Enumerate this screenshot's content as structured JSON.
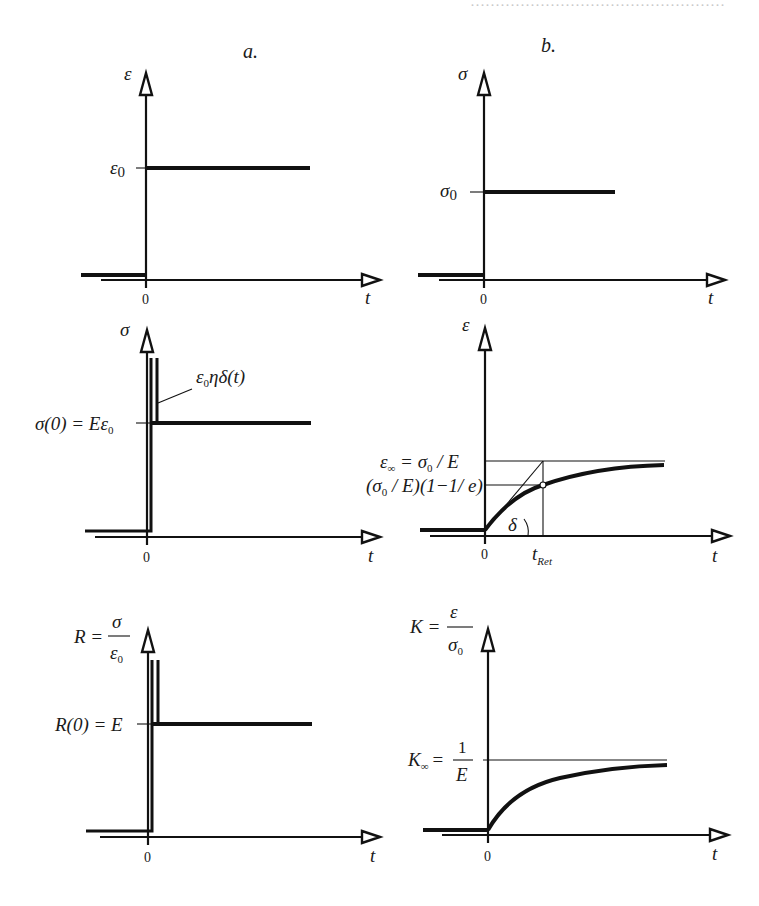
{
  "figure": {
    "column_labels": {
      "a": "a.",
      "b": "b."
    },
    "panels": {
      "a1": {
        "y_axis_label": "ε",
        "x_axis_label": "t",
        "origin_label": "0",
        "level_label_main": "ε",
        "level_label_sub": "0",
        "description": "Step strain input ε(t) = ε0·H(t)"
      },
      "b1": {
        "y_axis_label": "σ",
        "x_axis_label": "t",
        "origin_label": "0",
        "level_label_main": "σ",
        "level_label_sub": "0",
        "description": "Step stress input σ(t) = σ0·H(t)"
      },
      "a2": {
        "y_axis_label": "σ",
        "x_axis_label": "t",
        "origin_label": "0",
        "level_label": "σ(0) = Eε",
        "level_label_sub": "0",
        "impulse_label_pre": "ε",
        "impulse_label_sub": "0",
        "impulse_label_post": "ηδ(t)",
        "description": "Stress response: impulse plus constant level"
      },
      "b2": {
        "y_axis_label": "ε",
        "x_axis_label": "t",
        "origin_label": "0",
        "asymptote_label_a": "ε",
        "asymptote_label_a_sub": "∞",
        "asymptote_label_b": " = σ",
        "asymptote_label_b_sub": "0",
        "asymptote_label_c": " / E",
        "retard_level_label_a": "(σ",
        "retard_level_label_a_sub": "0",
        "retard_level_label_b": " / E)(1−1/ e)",
        "angle_label": "δ",
        "tick_label_main": "t",
        "tick_label_sub": "Ret",
        "description": "Creep strain response approaching σ0/E with retardation time t_Ret"
      },
      "a3": {
        "y_axis_label_left": "R =",
        "y_axis_label_num": "σ",
        "y_axis_label_den": "ε",
        "y_axis_label_den_sub": "0",
        "x_axis_label": "t",
        "origin_label": "0",
        "level_label": "R(0) = E",
        "description": "Relaxation function R(t)"
      },
      "b3": {
        "y_axis_label_left": "K =",
        "y_axis_label_num": "ε",
        "y_axis_label_den": "σ",
        "y_axis_label_den_sub": "0",
        "x_axis_label": "t",
        "origin_label": "0",
        "asymptote_label_left": "K",
        "asymptote_label_sub": "∞",
        "asymptote_label_eq": "=",
        "asymptote_label_num": "1",
        "asymptote_label_den": "E",
        "description": "Creep compliance K(t)"
      }
    }
  }
}
